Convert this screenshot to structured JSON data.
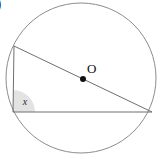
{
  "figure": {
    "canvas": {
      "width": 162,
      "height": 159,
      "background": "#ffffff"
    },
    "corner_marker": {
      "text": ")",
      "description": "clipped glyph at top-left edge"
    },
    "circle": {
      "label": "circle",
      "center_x": 81,
      "center_y": 78,
      "radius": 75,
      "stroke": "#8c8c8c",
      "stroke_width": 1,
      "fill": "none"
    },
    "center_point": {
      "label": "O",
      "x": 83,
      "y": 79,
      "dot_radius": 3,
      "dot_color": "#111111",
      "label_x": 87,
      "label_y": 73
    },
    "triangle": {
      "stroke": "#6e6e6e",
      "stroke_width": 1,
      "fill": "none",
      "vertices": [
        {
          "name": "A",
          "x": 14,
          "y": 46
        },
        {
          "name": "B",
          "x": 13,
          "y": 112
        },
        {
          "name": "C",
          "x": 152,
          "y": 112
        }
      ],
      "path": "M 14 46 L 13 112 L 152 112 Z",
      "hypotenuse_is_diameter": true
    },
    "angle_marker": {
      "label": "x",
      "vertex": "B",
      "vertex_x": 13,
      "vertex_y": 112,
      "sector_radius": 22,
      "fill": "#d9d9d9",
      "fill_opacity": 0.75,
      "label_x": 25,
      "label_y": 105,
      "start_angle_deg": -90,
      "end_angle_deg": 0
    }
  }
}
